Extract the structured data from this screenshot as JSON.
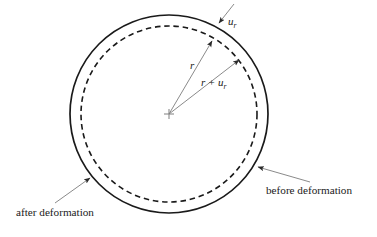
{
  "figure": {
    "background_color": "#ffffff",
    "stroke_color": "#1a1a1a",
    "leader_color": "#6b6b6b",
    "width": 377,
    "height": 237
  },
  "shapes": {
    "outer_circle": {
      "name": "after deformation circle",
      "style": "solid",
      "center_x": 169,
      "center_y": 114,
      "radius": 99
    },
    "inner_circle": {
      "name": "before deformation circle",
      "style": "dashed",
      "center_x": 169,
      "center_y": 114,
      "radius": 88
    },
    "center_marker": {
      "name": "center cross",
      "x": 169,
      "y": 114,
      "size": 5
    }
  },
  "annotations": {
    "displacement": {
      "symbol": "u",
      "subscript": "r",
      "text_x": 228,
      "text_y": 25,
      "leader_start_x": 234,
      "leader_start_y": 4,
      "leader_end_x": 219,
      "leader_end_y": 23
    },
    "radius": {
      "symbol": "r",
      "subscript": "",
      "text_x": 190,
      "text_y": 69,
      "arrow_start_x": 169,
      "arrow_start_y": 114,
      "arrow_end_x": 212,
      "arrow_end_y": 41
    },
    "deformed_radius": {
      "symbol": "r",
      "operator": "+",
      "term_symbol": "u",
      "term_subscript": "r",
      "text_x": 201,
      "text_y": 86,
      "arrow_start_x": 169,
      "arrow_start_y": 114,
      "arrow_end_x": 239,
      "arrow_end_y": 60
    },
    "after_deformation": {
      "label": "after deformation",
      "text_x": 16,
      "text_y": 216,
      "leader_start_x": 55,
      "leader_start_y": 203,
      "leader_end_x": 90,
      "leader_end_y": 178
    },
    "before_deformation": {
      "label": "before deformation",
      "text_x": 266,
      "text_y": 194,
      "leader_start_x": 310,
      "leader_start_y": 182,
      "leader_end_x": 258,
      "leader_end_y": 167
    }
  }
}
